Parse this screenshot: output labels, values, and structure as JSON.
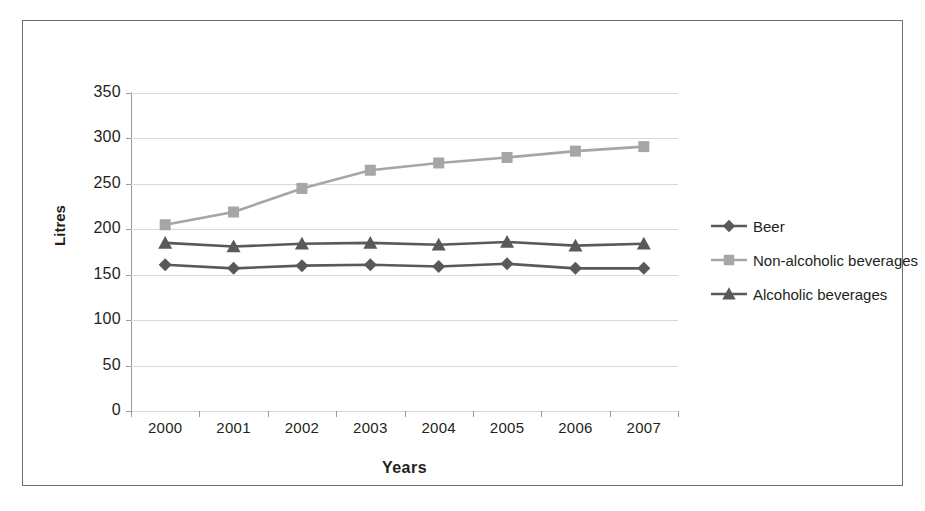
{
  "chart_data": {
    "type": "line",
    "title": "",
    "xlabel": "Years",
    "ylabel": "Litres",
    "categories": [
      "2000",
      "2001",
      "2002",
      "2003",
      "2004",
      "2005",
      "2006",
      "2007"
    ],
    "ylim": [
      0,
      350
    ],
    "yticks": [
      "0",
      "50",
      "100",
      "150",
      "200",
      "250",
      "300",
      "350"
    ],
    "grid": true,
    "legend_position": "right",
    "series": [
      {
        "name": "Beer",
        "marker": "diamond",
        "color": "#595959",
        "values": [
          161,
          157,
          160,
          161,
          159,
          162,
          157,
          157
        ]
      },
      {
        "name": "Non-alcoholic beverages",
        "marker": "square",
        "color": "#a6a6a6",
        "values": [
          205,
          219,
          245,
          265,
          273,
          279,
          286,
          291
        ]
      },
      {
        "name": "Alcoholic beverages",
        "marker": "triangle",
        "color": "#595959",
        "values": [
          185,
          181,
          184,
          185,
          183,
          186,
          182,
          184
        ]
      }
    ]
  },
  "frame": {
    "border_color": "#6e6e6e"
  }
}
